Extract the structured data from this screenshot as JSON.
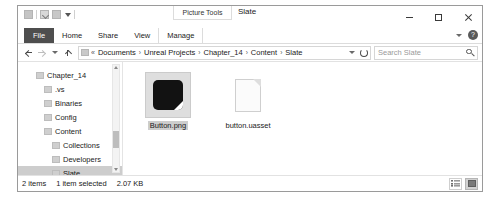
{
  "window": {
    "contextual_tools_label": "Picture Tools",
    "title": "Slate",
    "controls": {
      "minimize": "minimize-icon",
      "maximize": "maximize-icon",
      "close": "close-icon"
    }
  },
  "quick_access": {
    "items": [
      {
        "name": "qat-folder-icon",
        "label": "folder-icon"
      },
      {
        "name": "qat-properties-icon",
        "label": "properties-icon"
      },
      {
        "name": "qat-new-folder-icon",
        "label": "new-folder-icon"
      },
      {
        "name": "qat-customize-icon",
        "label": "chevron-down-icon"
      }
    ]
  },
  "ribbon": {
    "tabs": [
      {
        "label": "File",
        "active": false
      },
      {
        "label": "Home",
        "active": false
      },
      {
        "label": "Share",
        "active": false
      },
      {
        "label": "View",
        "active": false
      },
      {
        "label": "Manage",
        "active": true
      }
    ],
    "collapse_icon": "chevron-down-icon",
    "help_label": "?"
  },
  "address": {
    "back_icon": "back-arrow-icon",
    "forward_icon": "forward-arrow-icon",
    "recent_icon": "chevron-down-icon",
    "up_icon": "up-arrow-icon",
    "path_lead": "«",
    "crumbs": [
      "Documents",
      "Unreal Projects",
      "Chapter_14",
      "Content",
      "Slate"
    ],
    "separator": "›",
    "dropdown_icon": "chevron-down-icon",
    "refresh_icon": "refresh-icon"
  },
  "search": {
    "placeholder": "Search Slate",
    "value": "",
    "icon": "search-icon"
  },
  "nav_pane": {
    "items": [
      {
        "label": "Chapter_14",
        "indent": 0,
        "selected": false
      },
      {
        "label": ".vs",
        "indent": 1,
        "selected": false
      },
      {
        "label": "Binaries",
        "indent": 1,
        "selected": false
      },
      {
        "label": "Config",
        "indent": 1,
        "selected": false
      },
      {
        "label": "Content",
        "indent": 1,
        "selected": false
      },
      {
        "label": "Collections",
        "indent": 2,
        "selected": false
      },
      {
        "label": "Developers",
        "indent": 2,
        "selected": false
      },
      {
        "label": "Slate",
        "indent": 2,
        "selected": true
      }
    ],
    "scrollbar": {
      "up_icon": "scroll-up-icon",
      "down_icon": "scroll-down-icon"
    }
  },
  "files": {
    "items": [
      {
        "name": "Button.png",
        "icon": "png-thumbnail",
        "selected": true
      },
      {
        "name": "button.uasset",
        "icon": "generic-file-icon",
        "selected": false
      }
    ]
  },
  "status": {
    "item_count": "2 items",
    "selection": "1 item selected",
    "size": "2.07 KB",
    "view_buttons": [
      {
        "name": "details-view-button",
        "active": false
      },
      {
        "name": "large-icons-view-button",
        "active": true
      }
    ]
  }
}
